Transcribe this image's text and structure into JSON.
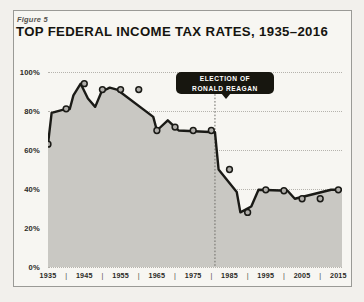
{
  "figure": {
    "label": "Figure 5",
    "title": "TOP FEDERAL INCOME TAX RATES, 1935–2016"
  },
  "annotation": {
    "line1": "ELECTION OF",
    "line2": "RONALD REAGAN",
    "year": 1981
  },
  "colors": {
    "page_background": "#f2f0ec",
    "panel_background": "#f7f6f2",
    "panel_border": "#9a9a96",
    "area_fill": "#c9c8c3",
    "line": "#1a1a16",
    "marker_fill": "#b0aeaa",
    "marker_stroke": "#1a1a16",
    "gridline": "#b5b3ad",
    "callout_background": "#17160f",
    "callout_text": "#ffffff",
    "text": "#15140f"
  },
  "chart_data": {
    "type": "area",
    "title": "TOP FEDERAL INCOME TAX RATES, 1935–2016",
    "xlabel": "",
    "ylabel": "",
    "xlim": [
      1935,
      2016
    ],
    "ylim": [
      0,
      100
    ],
    "grid": true,
    "legend": null,
    "y_ticks": [
      0,
      20,
      40,
      60,
      80,
      100
    ],
    "y_tick_labels": [
      "0%",
      "20%",
      "40%",
      "60%",
      "80%",
      "100%"
    ],
    "x_tick_labels": [
      "1935",
      "1945",
      "1955",
      "1965",
      "1975",
      "1985",
      "1995",
      "2005",
      "2015"
    ],
    "x_tick_label_years": [
      1935,
      1945,
      1955,
      1965,
      1975,
      1985,
      1995,
      2005,
      2015
    ],
    "x_minor_tick_years": [
      1940,
      1950,
      1960,
      1970,
      1980,
      1990,
      2000,
      2010
    ],
    "x": [
      1935,
      1936,
      1940,
      1941,
      1942,
      1944,
      1946,
      1948,
      1950,
      1951,
      1952,
      1954,
      1964,
      1965,
      1968,
      1970,
      1971,
      1981,
      1982,
      1987,
      1988,
      1991,
      1993,
      2001,
      2003,
      2013,
      2016
    ],
    "values": [
      63,
      79,
      81.1,
      81,
      88,
      94,
      86.45,
      82.13,
      91,
      91,
      92,
      91,
      77,
      70,
      75.25,
      71.75,
      70,
      69.125,
      50,
      38.5,
      28,
      31,
      39.6,
      39.1,
      35,
      39.6,
      39.6
    ],
    "marker_years": [
      1935,
      1940,
      1945,
      1950,
      1955,
      1960,
      1965,
      1970,
      1975,
      1980,
      1985,
      1990,
      1995,
      2000,
      2005,
      2010,
      2015
    ],
    "marker_values": [
      63,
      81.1,
      94,
      91,
      91,
      91,
      70,
      71.75,
      70,
      70,
      50,
      28,
      39.6,
      39.1,
      35,
      35,
      39.6
    ],
    "annotations": [
      {
        "year": 1981,
        "text": "ELECTION OF RONALD REAGAN"
      }
    ]
  }
}
